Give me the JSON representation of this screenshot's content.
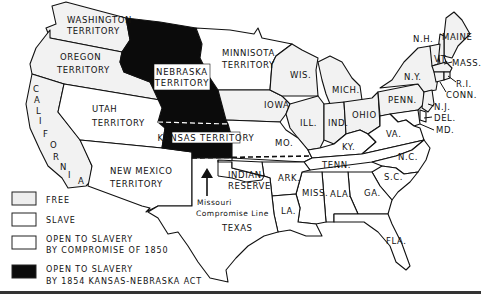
{
  "map": {
    "title": "Kansas-Nebraska Act territorial map",
    "colors": {
      "free": "#f2f2f2",
      "slave": "#ffffff",
      "open_1850": "#ffffff",
      "open_1854": "#0b0b0b",
      "outline": "#111111"
    },
    "regions": {
      "washington": "WASHINGTON TERRITORY",
      "oregon": "OREGON TERRITORY",
      "california": "CALIFORNIA",
      "utah": "UTAH TERRITORY",
      "new_mexico": "NEW MEXICO TERRITORY",
      "nebraska": "NEBRASKA TERRITORY",
      "kansas": "KANSAS TERRITORY",
      "minnesota": "MINNISOTA TERRITORY",
      "indian_reserve": "INDIAN RESERVE",
      "texas": "TEXAS"
    },
    "labels": {
      "washington_1": "WASHINGTON",
      "washington_2": "TERRITORY",
      "oregon_1": "OREGON",
      "oregon_2": "TERRITORY",
      "utah_1": "UTAH",
      "utah_2": "TERRITORY",
      "new_mexico_1": "NEW MEXICO",
      "new_mexico_2": "TERRITORY",
      "nebraska_1": "NEBRASKA",
      "nebraska_2": "TERRITORY",
      "kansas": "KANSAS TERRITORY",
      "minnesota_1": "MINNISOTA",
      "minnesota_2": "TERRITORY",
      "indian_1": "INDIAN",
      "indian_2": "RESERVE",
      "missouri_line_1": "Missouri",
      "missouri_line_2": "Compromise Line",
      "texas": "TEXAS",
      "cal_letters": [
        "C",
        "A",
        "L",
        "I",
        "F",
        "O",
        "R",
        "N",
        "I",
        "A"
      ],
      "wis": "WIS.",
      "mich": "MICH.",
      "iowa": "IOWA",
      "ill": "ILL.",
      "ind": "IND.",
      "ohio": "OHIO",
      "mo": "MO.",
      "ky": "KY.",
      "tenn": "TENN.",
      "ark": "ARK.",
      "la": "LA.",
      "miss": "MISS.",
      "ala": "ALA.",
      "ga": "GA.",
      "fla": "FLA.",
      "sc": "S.C.",
      "nc": "N.C.",
      "va": "VA.",
      "penn": "PENN.",
      "ny": "N.Y.",
      "nh": "N.H.",
      "maine": "MAINE",
      "vt": "VT.",
      "mass": "MASS.",
      "ri": "R.I.",
      "conn": "CONN.",
      "nj": "N.J.",
      "del": "DEL.",
      "md": "MD."
    }
  },
  "legend": {
    "items": [
      {
        "key": "free",
        "label_1": "FREE",
        "label_2": ""
      },
      {
        "key": "slave",
        "label_1": "SLAVE",
        "label_2": ""
      },
      {
        "key": "open_1850",
        "label_1": "OPEN TO SLAVERY",
        "label_2": "BY COMPROMISE OF 1850"
      },
      {
        "key": "open_1854",
        "label_1": "OPEN TO SLAVERY",
        "label_2": "BY 1854 KANSAS-NEBRASKA ACT"
      }
    ]
  }
}
